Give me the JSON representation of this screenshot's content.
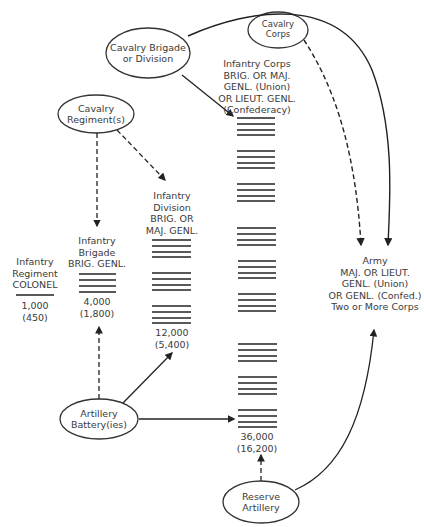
{
  "diagram": {
    "ovals": {
      "cavalry_brigade": {
        "lines": [
          "Cavalry Brigade",
          "or Division"
        ]
      },
      "cavalry_corps": {
        "lines": [
          "Cavalry",
          "Corps"
        ]
      },
      "cavalry_regiment": {
        "lines": [
          "Cavalry",
          "Regiment(s)"
        ]
      },
      "artillery_battery": {
        "lines": [
          "Artillery",
          "Battery(ies)"
        ]
      },
      "reserve_artillery": {
        "lines": [
          "Reserve",
          "Artillery"
        ]
      }
    },
    "units": {
      "infantry_regiment": {
        "lines": [
          "Infantry",
          "Regiment",
          "COLONEL"
        ],
        "strength": "1,000",
        "actual": "(450)"
      },
      "infantry_brigade": {
        "lines": [
          "Infantry",
          "Brigade",
          "BRIG. GENL."
        ],
        "strength": "4,000",
        "actual": "(1,800)"
      },
      "infantry_division": {
        "lines": [
          "Infantry",
          "Division",
          "BRIG. OR",
          "MAJ. GENL."
        ],
        "strength": "12,000",
        "actual": "(5,400)"
      },
      "infantry_corps": {
        "lines": [
          "Infantry Corps",
          "BRIG. OR MAJ.",
          "GENL. (Union)",
          "OR LIEUT. GENL.",
          "(Confederacy)"
        ],
        "strength": "36,000",
        "actual": "(16,200)"
      },
      "army": {
        "lines": [
          "Army",
          "MAJ. OR LIEUT.",
          "GENL. (Union)",
          "OR GENL. (Confed.)",
          "Two or More Corps"
        ]
      }
    },
    "legend_note": {
      "solid_arrow": "assigned/attached",
      "dashed_arrow": "optional/supporting attachment"
    }
  }
}
